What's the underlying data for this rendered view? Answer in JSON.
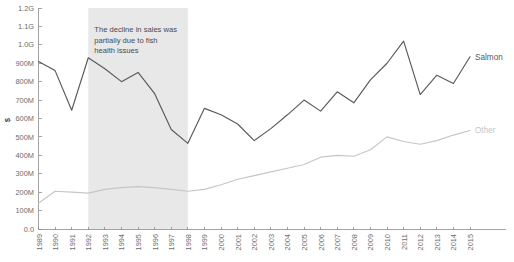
{
  "chart_data": {
    "type": "line",
    "title": "",
    "xlabel": "",
    "ylabel": "$",
    "ylim": [
      0,
      1200000000
    ],
    "grid": false,
    "legend_position": "right-inline-labels",
    "x": [
      1989,
      1990,
      1991,
      1992,
      1993,
      1994,
      1995,
      1996,
      1997,
      1998,
      1999,
      2000,
      2001,
      2002,
      2003,
      2004,
      2005,
      2006,
      2007,
      2008,
      2009,
      2010,
      2011,
      2012,
      2013,
      2014,
      2015
    ],
    "categories": [
      "1989",
      "1990",
      "1991",
      "1992",
      "1993",
      "1994",
      "1995",
      "1996",
      "1997",
      "1998",
      "1999",
      "2000",
      "2001",
      "2002",
      "2003",
      "2004",
      "2005",
      "2006",
      "2007",
      "2008",
      "2009",
      "2010",
      "2011",
      "2012",
      "2013",
      "2014",
      "2015"
    ],
    "ytick_labels": [
      "0.0",
      "100M",
      "200M",
      "300M",
      "400M",
      "500M",
      "600M",
      "700M",
      "800M",
      "900M",
      "1.0G",
      "1.1G",
      "1.2G"
    ],
    "ytick_values": [
      0,
      100000000,
      200000000,
      300000000,
      400000000,
      500000000,
      600000000,
      700000000,
      800000000,
      900000000,
      1000000000,
      1100000000,
      1200000000
    ],
    "series": [
      {
        "name": "Salmon",
        "color": "#595959",
        "values": [
          910000000,
          860000000,
          645000000,
          930000000,
          870000000,
          800000000,
          850000000,
          735000000,
          540000000,
          465000000,
          655000000,
          620000000,
          570000000,
          480000000,
          545000000,
          620000000,
          700000000,
          640000000,
          745000000,
          685000000,
          810000000,
          900000000,
          1020000000,
          730000000,
          835000000,
          790000000,
          935000000
        ]
      },
      {
        "name": "Other",
        "color": "#c6c6c6",
        "values": [
          140000000,
          205000000,
          200000000,
          195000000,
          215000000,
          225000000,
          230000000,
          225000000,
          215000000,
          205000000,
          215000000,
          240000000,
          270000000,
          290000000,
          310000000,
          330000000,
          350000000,
          390000000,
          400000000,
          395000000,
          430000000,
          500000000,
          475000000,
          460000000,
          480000000,
          510000000,
          535000000
        ]
      }
    ],
    "annotations": [
      {
        "name": "decline-band",
        "type": "vertical-band",
        "x_start": 1992,
        "x_end": 1998,
        "color": "#e8e8e8",
        "lines": [
          "The decline in sales was",
          "partially due to fish",
          "health issues"
        ]
      }
    ]
  }
}
